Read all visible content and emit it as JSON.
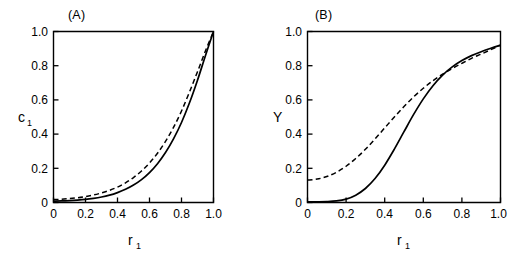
{
  "figure": {
    "background_color": "#ffffff",
    "line_color": "#000000"
  },
  "panels": [
    {
      "key": "A",
      "label": "(A)",
      "xlabel_base": "r",
      "xlabel_sub": "1",
      "ylabel_base": "c",
      "ylabel_sub": "1",
      "xticks": [
        "0",
        "0.2",
        "0.4",
        "0.6",
        "0.8",
        "1.0"
      ],
      "yticks": [
        "0",
        "0.2",
        "0.4",
        "0.6",
        "0.8",
        "1.0"
      ]
    },
    {
      "key": "B",
      "label": "(B)",
      "xlabel_base": "r",
      "xlabel_sub": "1",
      "ylabel_base": "Y",
      "ylabel_sub": "",
      "xticks": [
        "0",
        "0.2",
        "0.4",
        "0.6",
        "0.8",
        "1.0"
      ],
      "yticks": [
        "0",
        "0.2",
        "0.4",
        "0.6",
        "0.8",
        "1.0"
      ]
    }
  ],
  "chart_data": [
    {
      "type": "line",
      "panel": "A",
      "title": "(A)",
      "xlabel": "r1",
      "ylabel": "c1",
      "xlim": [
        0,
        1
      ],
      "ylim": [
        0,
        1
      ],
      "grid": false,
      "legend": "none",
      "xticks": [
        0,
        0.2,
        0.4,
        0.6,
        0.8,
        1.0
      ],
      "yticks": [
        0,
        0.2,
        0.4,
        0.6,
        0.8,
        1.0
      ],
      "x": [
        0,
        0.05,
        0.1,
        0.15,
        0.2,
        0.25,
        0.3,
        0.35,
        0.4,
        0.45,
        0.5,
        0.55,
        0.6,
        0.65,
        0.7,
        0.75,
        0.8,
        0.85,
        0.9,
        0.95,
        1.0
      ],
      "series": [
        {
          "name": "solid",
          "style": "solid",
          "values": [
            0.008,
            0.009,
            0.011,
            0.014,
            0.018,
            0.024,
            0.032,
            0.043,
            0.058,
            0.077,
            0.102,
            0.134,
            0.175,
            0.227,
            0.292,
            0.372,
            0.468,
            0.583,
            0.715,
            0.86,
            1.0
          ]
        },
        {
          "name": "dashed",
          "style": "dashed",
          "values": [
            0.017,
            0.019,
            0.023,
            0.028,
            0.035,
            0.044,
            0.056,
            0.071,
            0.09,
            0.115,
            0.146,
            0.184,
            0.231,
            0.288,
            0.357,
            0.439,
            0.535,
            0.646,
            0.765,
            0.887,
            1.0
          ]
        }
      ]
    },
    {
      "type": "line",
      "panel": "B",
      "title": "(B)",
      "xlabel": "r1",
      "ylabel": "Y",
      "xlim": [
        0,
        1
      ],
      "ylim": [
        0,
        1
      ],
      "grid": false,
      "legend": "none",
      "xticks": [
        0,
        0.2,
        0.4,
        0.6,
        0.8,
        1.0
      ],
      "yticks": [
        0,
        0.2,
        0.4,
        0.6,
        0.8,
        1.0
      ],
      "x": [
        0,
        0.05,
        0.1,
        0.15,
        0.2,
        0.25,
        0.3,
        0.35,
        0.4,
        0.45,
        0.5,
        0.55,
        0.6,
        0.65,
        0.7,
        0.75,
        0.8,
        0.85,
        0.9,
        0.95,
        1.0
      ],
      "series": [
        {
          "name": "solid",
          "style": "solid",
          "values": [
            0.004,
            0.004,
            0.005,
            0.009,
            0.02,
            0.043,
            0.082,
            0.14,
            0.218,
            0.312,
            0.414,
            0.515,
            0.606,
            0.683,
            0.745,
            0.793,
            0.83,
            0.859,
            0.882,
            0.902,
            0.92
          ]
        },
        {
          "name": "dashed",
          "style": "dashed",
          "values": [
            0.131,
            0.137,
            0.152,
            0.177,
            0.212,
            0.257,
            0.311,
            0.372,
            0.436,
            0.5,
            0.561,
            0.618,
            0.668,
            0.712,
            0.75,
            0.784,
            0.814,
            0.843,
            0.868,
            0.894,
            0.92
          ]
        }
      ]
    }
  ]
}
